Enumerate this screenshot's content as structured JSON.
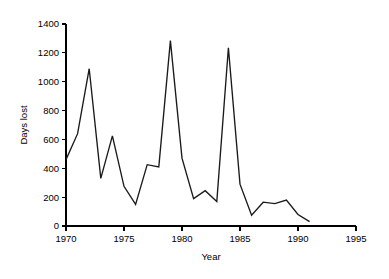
{
  "chart_data": {
    "type": "line",
    "title": "",
    "xlabel": "Year",
    "ylabel": "Days lost",
    "xlim": [
      1970,
      1995
    ],
    "ylim": [
      0,
      1400
    ],
    "grid": false,
    "legend": null,
    "x_ticks": [
      1970,
      1975,
      1980,
      1985,
      1990,
      1995
    ],
    "y_ticks": [
      0,
      200,
      400,
      600,
      800,
      1000,
      1200,
      1400
    ],
    "x_tick_labels": [
      "1970",
      "1975",
      "1980",
      "1985",
      "1990",
      "1995"
    ],
    "y_tick_labels": [
      "0",
      "200",
      "400",
      "600",
      "800",
      "1000",
      "1200",
      "1400"
    ],
    "series": [
      {
        "name": "Days lost",
        "color": "#1a1a1a",
        "x": [
          1970,
          1971,
          1972,
          1973,
          1974,
          1975,
          1976,
          1977,
          1978,
          1979,
          1980,
          1981,
          1982,
          1983,
          1984,
          1985,
          1986,
          1987,
          1988,
          1989,
          1990,
          1991
        ],
        "values": [
          460,
          640,
          1090,
          330,
          625,
          275,
          150,
          425,
          410,
          1285,
          470,
          190,
          245,
          170,
          1235,
          290,
          75,
          165,
          155,
          180,
          80,
          30
        ]
      }
    ]
  },
  "axis_titles": {
    "x": "Year",
    "y": "Days lost"
  }
}
